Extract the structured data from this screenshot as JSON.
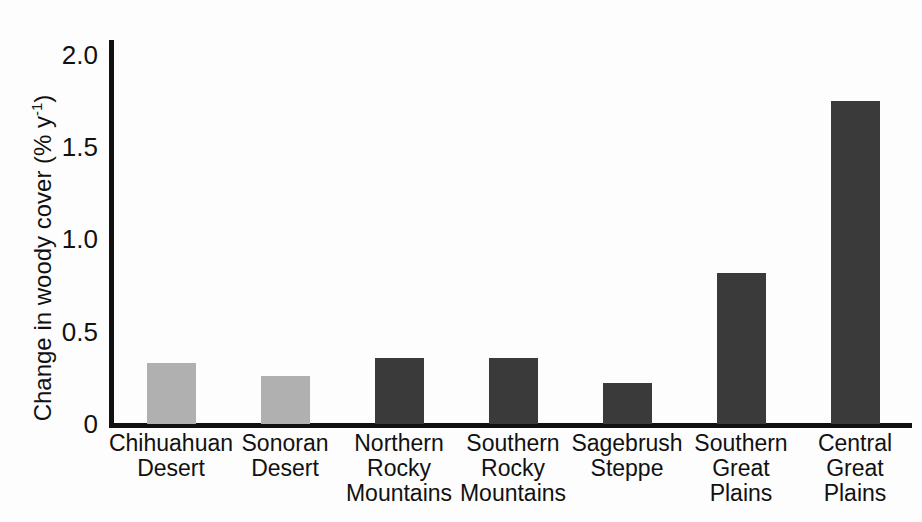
{
  "chart_data": {
    "type": "bar",
    "title": "",
    "xlabel": "",
    "ylabel": "Change in woody cover (% y⁻¹)",
    "ylabel_parts": {
      "main": "Change in woody cover (% y",
      "sup": "-1",
      "tail": ")"
    },
    "categories": [
      "Chihuahuan Desert",
      "Sonoran Desert",
      "Northern Rocky Mountains",
      "Southern Rocky Mountains",
      "Sagebrush Steppe",
      "Southern Great Plains",
      "Central Great Plains"
    ],
    "category_lines": [
      [
        "Chihuahuan",
        "Desert"
      ],
      [
        "Sonoran",
        "Desert"
      ],
      [
        "Northern",
        "Rocky",
        "Mountains"
      ],
      [
        "Southern",
        "Rocky",
        "Mountains"
      ],
      [
        "Sagebrush",
        "Steppe"
      ],
      [
        "Southern",
        "Great",
        "Plains"
      ],
      [
        "Central",
        "Great",
        "Plains"
      ]
    ],
    "values": [
      0.33,
      0.26,
      0.36,
      0.36,
      0.22,
      0.82,
      1.75
    ],
    "bar_colors": [
      "#b0b0b0",
      "#b0b0b0",
      "#3a3a3a",
      "#3a3a3a",
      "#3a3a3a",
      "#3a3a3a",
      "#3a3a3a"
    ],
    "ylim": [
      0,
      2.08
    ],
    "yticks": [
      0,
      0.5,
      1.0,
      1.5,
      2.0
    ],
    "ytick_labels": [
      "0",
      "0.5",
      "1.0",
      "1.5",
      "2.0"
    ],
    "grid": false,
    "legend": null,
    "axis_color": "#111111",
    "background": "#fdfdfd"
  }
}
